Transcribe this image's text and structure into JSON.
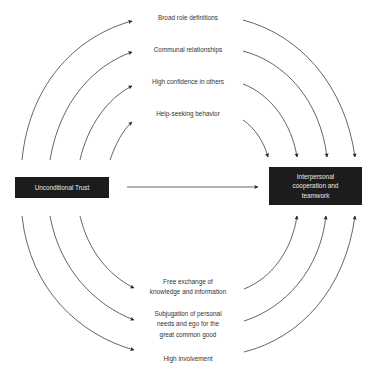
{
  "diagram": {
    "source_node": {
      "label": "Unconditional Trust"
    },
    "target_node": {
      "label": "Interpersonal cooperation and teamwork",
      "lines": [
        "Interpersonal",
        "cooperation and",
        "teamwork"
      ]
    },
    "upper_mediators": [
      {
        "label": "Broad role definitions"
      },
      {
        "label": "Communal relationships"
      },
      {
        "label": "High confidence in others"
      },
      {
        "label": "Help-seeking behavior"
      }
    ],
    "lower_mediators": [
      {
        "label": "Free exchange of knowledge and information",
        "lines": [
          "Free exchange of",
          "knowledge and information"
        ]
      },
      {
        "label": "Subjugation of personal needs and ego for the great common good",
        "lines": [
          "Subjugation of personal",
          "needs and ego for the",
          "great common good"
        ]
      },
      {
        "label": "High involvement",
        "lines": [
          "High involvement"
        ]
      }
    ],
    "direct_edge": {
      "from": "Unconditional Trust",
      "to": "Interpersonal cooperation and teamwork"
    },
    "colors": {
      "box_fill": "#1c1c1c",
      "box_text": "#e8e8e8",
      "line": "#222222",
      "label_text": "#333333"
    }
  }
}
